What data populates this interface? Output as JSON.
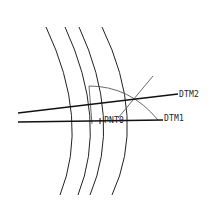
{
  "diagram": {
    "type": "cad-sketch",
    "labels": {
      "dtm2": "DTM2",
      "dtm1": "DTM1",
      "pnt0": "PNT0"
    },
    "colors": {
      "line": "#1a1a1a",
      "thin": "#444444",
      "background": "#ffffff"
    },
    "elements": {
      "arcs": 4,
      "datum_planes": [
        "DTM1",
        "DTM2"
      ],
      "datum_points": [
        "PNT0"
      ]
    }
  }
}
